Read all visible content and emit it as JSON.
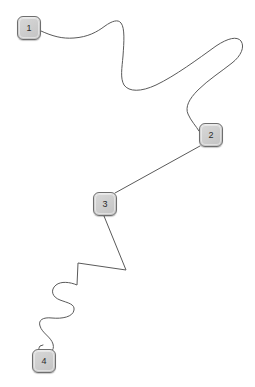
{
  "diagram": {
    "width": 255,
    "height": 387,
    "background_color": "#ffffff",
    "node_fill_color": "#cfcfcf",
    "node_border_color": "#6e6e6e",
    "node_label_color": "#2a2a2a",
    "edge_color": "#5a5a5a",
    "edge_width": 1
  },
  "nodes": [
    {
      "id": "node-1",
      "label": "1",
      "x": 17,
      "y": 16,
      "width": 24,
      "height": 24
    },
    {
      "id": "node-2",
      "label": "2",
      "x": 199,
      "y": 123,
      "width": 24,
      "height": 24
    },
    {
      "id": "node-3",
      "label": "3",
      "x": 93,
      "y": 192,
      "width": 24,
      "height": 24
    },
    {
      "id": "node-4",
      "label": "4",
      "x": 32,
      "y": 349,
      "width": 24,
      "height": 24
    }
  ],
  "edges": [
    {
      "id": "edge-1-2",
      "from": "1",
      "to": "2",
      "style": "wavy-curve",
      "path": "M 41 31 C 52 36, 62 39, 74 38 C 88 37, 97 32, 105 26 C 112 21, 118 19, 121 23 C 125 28, 124 42, 123 56 C 122 68, 120 78, 124 85 C 129 92, 141 92, 156 85 C 175 76, 198 59, 216 46 C 228 38, 237 36, 241 41 C 245 47, 241 56, 232 63 C 222 71, 208 80, 198 90 C 189 99, 185 107, 188 114 C 191 121, 196 126, 199 131"
    },
    {
      "id": "edge-2-3",
      "from": "2",
      "to": "3",
      "style": "straight",
      "path": "M 200 146 L 115 193"
    },
    {
      "id": "edge-3-4",
      "from": "3",
      "to": "4",
      "style": "zigzag-then-serpentine",
      "path": "M 104 216 L 126 270 L 78 263 L 77 285 C 70 282, 61 281, 56 285 C 50 290, 52 297, 60 300 C 68 303, 75 304, 74 310 C 73 317, 62 319, 52 318 C 43 317, 38 320, 40 326 C 42 333, 51 337, 53 344 C 55 351, 49 355, 43 354 C 38 353, 38 349, 40 346 L 43 345"
    }
  ]
}
